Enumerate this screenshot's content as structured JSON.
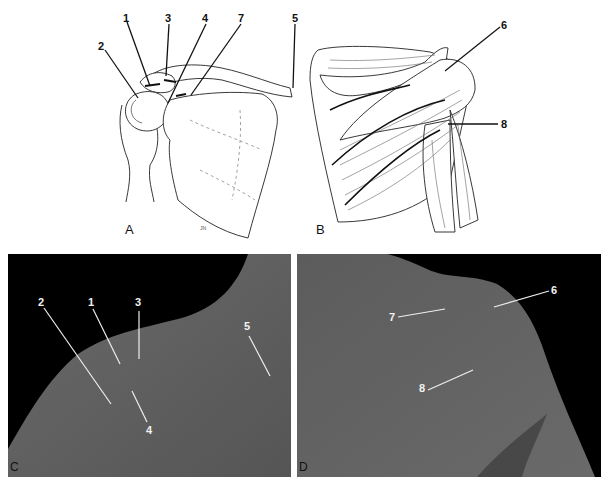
{
  "figure": {
    "panels": [
      {
        "id": "A",
        "label": "A",
        "kind": "line-drawing",
        "subject": "shoulder skeleton anterior view (clavicle, acromion, humeral head, scapula)",
        "callouts": [
          "1",
          "2",
          "3",
          "4",
          "5",
          "7"
        ],
        "signature": "JN"
      },
      {
        "id": "B",
        "label": "B",
        "kind": "line-drawing",
        "subject": "posterior shoulder musculature",
        "callouts": [
          "6",
          "8"
        ]
      },
      {
        "id": "C",
        "label": "C",
        "kind": "photograph",
        "subject": "anterior shoulder surface anatomy",
        "callouts": [
          "1",
          "2",
          "3",
          "4",
          "5"
        ]
      },
      {
        "id": "D",
        "label": "D",
        "kind": "photograph",
        "subject": "posterior shoulder surface anatomy",
        "callouts": [
          "6",
          "7",
          "8"
        ]
      }
    ],
    "colors": {
      "background": "#ffffff",
      "ink": "#111111",
      "photo_skin": "#5e5e5e",
      "photo_bg": "#000000",
      "photo_callout": "#f2f2f2"
    }
  },
  "labels": {
    "a": "A",
    "b": "B",
    "c": "C",
    "d": "D",
    "n1": "1",
    "n2": "2",
    "n3": "3",
    "n4": "4",
    "n5": "5",
    "n6": "6",
    "n7": "7",
    "n8": "8",
    "sig": "JN"
  }
}
